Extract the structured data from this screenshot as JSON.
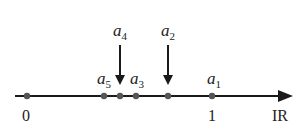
{
  "axis": {
    "label": "IR",
    "y": 96,
    "x_start": 15,
    "x_end": 293,
    "color": "#1a1a1a"
  },
  "points": [
    {
      "name": "zero",
      "x": 27,
      "tick_label": "0",
      "label": ""
    },
    {
      "name": "a5",
      "x": 104,
      "label": "a",
      "sub": "5"
    },
    {
      "name": "a4",
      "x": 120,
      "label": "a",
      "sub": "4"
    },
    {
      "name": "a3",
      "x": 136,
      "label": "a",
      "sub": "3"
    },
    {
      "name": "a2",
      "x": 168,
      "label": "a",
      "sub": "2"
    },
    {
      "name": "a1",
      "x": 212,
      "label": "a",
      "sub": "1",
      "tick_label": "1"
    }
  ],
  "labels": {
    "zero": "0",
    "one": "1",
    "axis": "IR",
    "a1": "a",
    "a1_sub": "1",
    "a2": "a",
    "a2_sub": "2",
    "a3": "a",
    "a3_sub": "3",
    "a4": "a",
    "a4_sub": "4",
    "a5": "a",
    "a5_sub": "5"
  },
  "point_color": "#555555"
}
